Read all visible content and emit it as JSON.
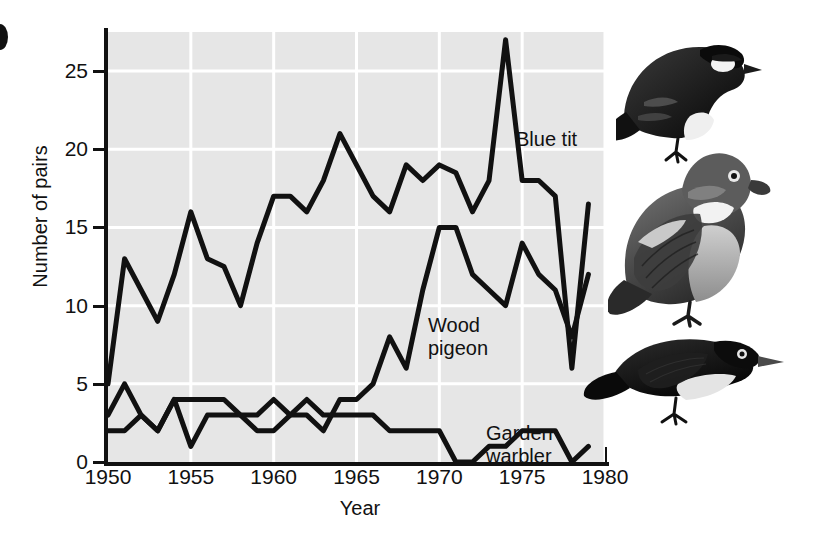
{
  "figure": {
    "marker": "",
    "y_axis_title": "Number of pairs",
    "x_axis_title": "Year"
  },
  "annotations": {
    "blue_tit": "Blue tit",
    "wood_pigeon": "Wood\npigeon",
    "garden_warbler": "Garden warbler"
  },
  "illustrations": [
    {
      "name": "blue-tit-illustration",
      "alt": "Blue tit"
    },
    {
      "name": "wood-pigeon-illustration",
      "alt": "Wood pigeon"
    },
    {
      "name": "garden-warbler-illustration",
      "alt": "Garden warbler"
    }
  ],
  "colors": {
    "plot_background": "#e6e6e6",
    "gridline": "#ffffff",
    "line": "#111111",
    "axis": "#111111",
    "page_background": "#ffffff"
  },
  "chart_data": {
    "type": "line",
    "title": "",
    "xlabel": "Year",
    "ylabel": "Number of pairs",
    "xlim": [
      1950,
      1980
    ],
    "ylim": [
      0,
      27.5
    ],
    "xticks": [
      1950,
      1955,
      1960,
      1965,
      1970,
      1975,
      1980
    ],
    "yticks": [
      0,
      5,
      10,
      15,
      20,
      25
    ],
    "xtick_labels": [
      "1950",
      "1955",
      "1960",
      "1965",
      "1970",
      "1975",
      "1980"
    ],
    "ytick_labels": [
      "0",
      "5",
      "10",
      "15",
      "20",
      "25"
    ],
    "grid": true,
    "grid_color": "#ffffff",
    "legend": "inline-annotations",
    "x": [
      1950,
      1951,
      1952,
      1953,
      1954,
      1955,
      1956,
      1957,
      1958,
      1959,
      1960,
      1961,
      1962,
      1963,
      1964,
      1965,
      1966,
      1967,
      1968,
      1969,
      1970,
      1971,
      1972,
      1973,
      1974,
      1975,
      1976,
      1977,
      1978,
      1979
    ],
    "series": [
      {
        "name": "Blue tit",
        "values": [
          5,
          13,
          11,
          9,
          12,
          16,
          13,
          12.5,
          10,
          14,
          17,
          17,
          16,
          18,
          21,
          19,
          17,
          16,
          19,
          18,
          19,
          18.5,
          16,
          18,
          27,
          18,
          18,
          17,
          6,
          16.5
        ]
      },
      {
        "name": "Wood pigeon",
        "values": [
          2,
          2,
          3,
          2,
          4,
          1,
          3,
          3,
          3,
          2,
          2,
          3,
          3,
          2,
          4,
          4,
          5,
          8,
          6,
          11,
          15,
          15,
          12,
          11,
          10,
          14,
          12,
          11,
          8,
          12
        ]
      },
      {
        "name": "Garden warbler",
        "values": [
          3,
          5,
          3,
          2,
          4,
          4,
          4,
          4,
          3,
          3,
          4,
          3,
          4,
          3,
          3,
          3,
          3,
          2,
          2,
          2,
          2,
          0,
          0,
          1,
          1,
          2,
          2,
          2,
          0,
          1
        ]
      }
    ]
  }
}
